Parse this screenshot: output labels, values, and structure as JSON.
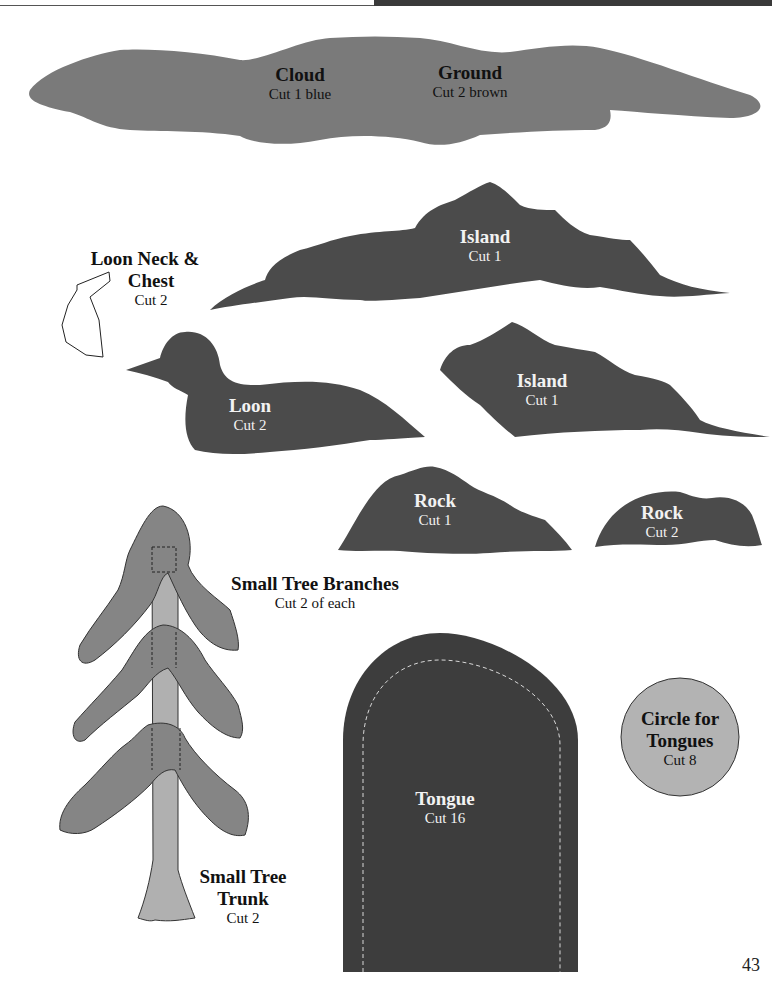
{
  "page": {
    "number": "43"
  },
  "colors": {
    "medium_gray": "#7a7a7a",
    "dark_gray": "#4b4b4b",
    "tongue_dark": "#3d3d3d",
    "light_gray": "#b3b3b3",
    "branch_gray": "#858585",
    "trunk_gray": "#b0b0b0"
  },
  "patterns": {
    "cloud": {
      "title": "Cloud",
      "instruction": "Cut 1 blue"
    },
    "ground": {
      "title": "Ground",
      "instruction": "Cut 2 brown"
    },
    "island_large": {
      "title": "Island",
      "instruction": "Cut 1"
    },
    "loon_neck": {
      "title_line1": "Loon Neck &",
      "title_line2": "Chest",
      "instruction": "Cut 2"
    },
    "loon": {
      "title": "Loon",
      "instruction": "Cut 2"
    },
    "island_small": {
      "title": "Island",
      "instruction": "Cut 1"
    },
    "rock_large": {
      "title": "Rock",
      "instruction": "Cut 1"
    },
    "rock_small": {
      "title": "Rock",
      "instruction": "Cut 2"
    },
    "tree_branches": {
      "title": "Small Tree Branches",
      "instruction": "Cut 2 of each"
    },
    "tree_trunk": {
      "title_line1": "Small Tree",
      "title_line2": "Trunk",
      "instruction": "Cut 2"
    },
    "tongue": {
      "title": "Tongue",
      "instruction": "Cut 16"
    },
    "circle": {
      "title_line1": "Circle for",
      "title_line2": "Tongues",
      "instruction": "Cut 8"
    }
  }
}
